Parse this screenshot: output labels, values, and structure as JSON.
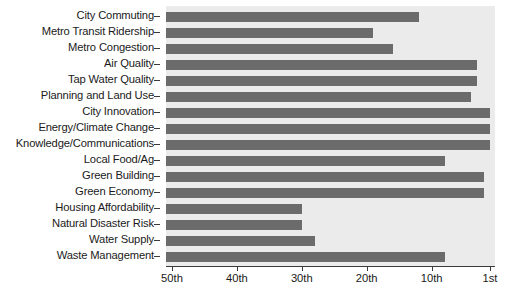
{
  "chart_data": {
    "type": "bar",
    "orientation": "horizontal",
    "title": "",
    "subtitle": "",
    "xlabel": "",
    "ylabel": "",
    "grid": false,
    "legend": null,
    "legend_position": "none",
    "axis_reversed_x": true,
    "xlim": [
      50,
      1
    ],
    "x_tick_values": [
      50,
      40,
      30,
      20,
      10,
      1
    ],
    "x_tick_labels": [
      "50th",
      "40th",
      "30th",
      "20th",
      "10th",
      "1st"
    ],
    "categories": [
      "City Commuting",
      "Metro Transit Ridership",
      "Metro Congestion",
      "Air Quality",
      "Tap Water Quality",
      "Planning and Land Use",
      "City Innovation",
      "Energy/Climate Change",
      "Knowledge/Communications",
      "Local Food/Ag",
      "Green Building",
      "Green Economy",
      "Housing Affordability",
      "Natural Disaster Risk",
      "Water Supply",
      "Waste Management"
    ],
    "values": [
      12,
      19,
      16,
      3,
      3,
      4,
      1,
      1,
      1,
      8,
      2,
      2,
      30,
      30,
      28,
      8
    ],
    "value_unit": "rank",
    "colors": {
      "bar": "#6b6b6b",
      "plot_background": "#ebebeb",
      "figure_background": "#ffffff",
      "axis": "#3a3a3a",
      "text": "#1a1a1a"
    }
  }
}
